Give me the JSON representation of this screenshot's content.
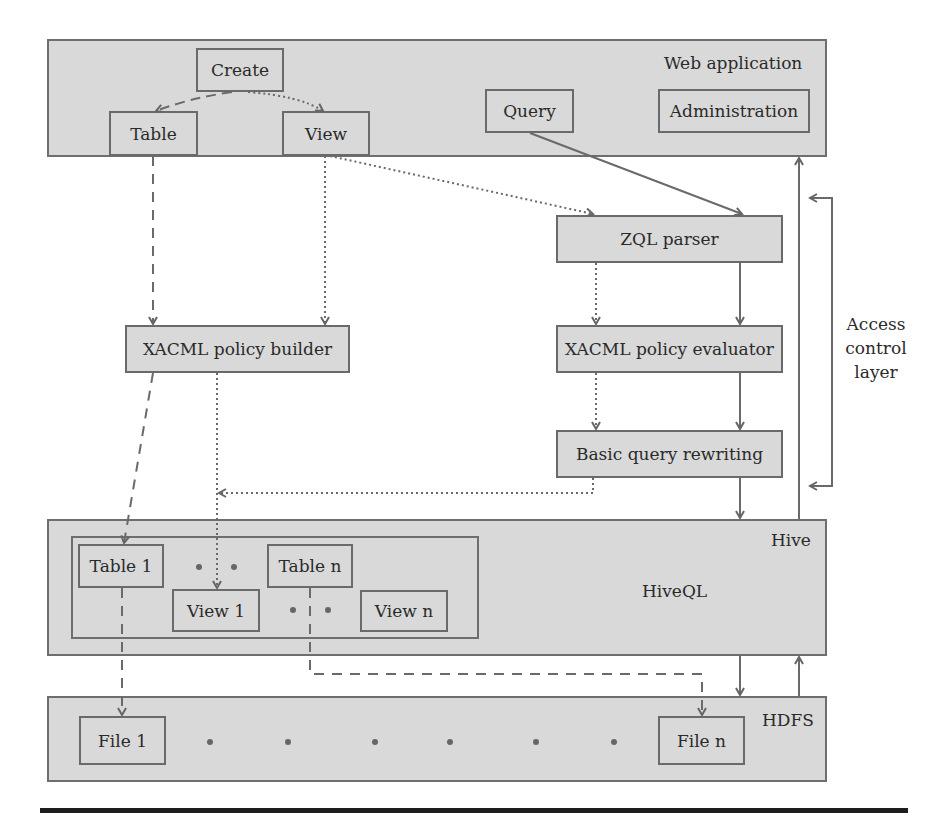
{
  "diagram": {
    "web_layer": {
      "label": "Web application",
      "create": "Create",
      "table": "Table",
      "view": "View",
      "query": "Query",
      "administration": "Administration"
    },
    "access_control": {
      "zql_parser": "ZQL parser",
      "policy_evaluator": "XACML policy evaluator",
      "query_rewriting": "Basic query rewriting",
      "policy_builder": "XACML policy builder",
      "layer_label_line1": "Access",
      "layer_label_line2": "control",
      "layer_label_line3": "layer"
    },
    "hive_layer": {
      "label": "Hive",
      "hiveql": "HiveQL",
      "table1": "Table 1",
      "tablen": "Table n",
      "view1": "View 1",
      "viewn": "View n"
    },
    "hdfs_layer": {
      "label": "HDFS",
      "file1": "File 1",
      "filen": "File n"
    },
    "colors": {
      "layer_fill": "#d9d9d9",
      "border": "#6e6e6e",
      "arrow": "#6a6a6a"
    }
  }
}
